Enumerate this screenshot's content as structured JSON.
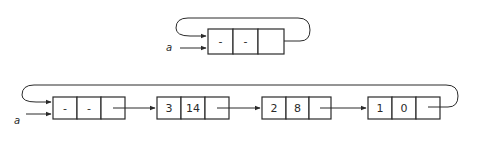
{
  "diagram": {
    "top_list": {
      "pointer_label": "a",
      "nodes": [
        {
          "fields": [
            "-",
            "-"
          ],
          "has_next": false,
          "loops_to_head": true
        }
      ]
    },
    "bottom_list": {
      "pointer_label": "a",
      "nodes": [
        {
          "fields": [
            "-",
            "-"
          ],
          "role": "header"
        },
        {
          "fields": [
            "3",
            "14"
          ]
        },
        {
          "fields": [
            "2",
            "8"
          ]
        },
        {
          "fields": [
            "1",
            "0"
          ],
          "loops_to_head": true
        }
      ]
    }
  }
}
